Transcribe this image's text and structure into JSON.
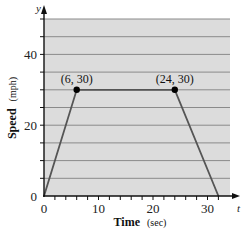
{
  "chart_data": {
    "type": "line",
    "title": "",
    "xlabel": "Time",
    "xlabel_unit": "(sec)",
    "ylabel": "Speed",
    "ylabel_unit": "(mph)",
    "x_axis_var": "t",
    "y_axis_var": "y",
    "xlim": [
      0,
      35
    ],
    "ylim": [
      0,
      50
    ],
    "x_ticks": [
      0,
      10,
      20,
      30
    ],
    "x_minor_tick_step": 2,
    "y_ticks": [
      0,
      20,
      40
    ],
    "y_grid_step": 5,
    "grid": true,
    "background": "#dcdcdc",
    "line_color": "#555555",
    "series": [
      {
        "name": "speed",
        "x": [
          0,
          6,
          24,
          32
        ],
        "y": [
          0,
          30,
          30,
          0
        ]
      }
    ],
    "annotations": [
      {
        "x": 6,
        "y": 30,
        "text": "(6, 30)"
      },
      {
        "x": 24,
        "y": 30,
        "text": "(24, 30)"
      }
    ]
  }
}
